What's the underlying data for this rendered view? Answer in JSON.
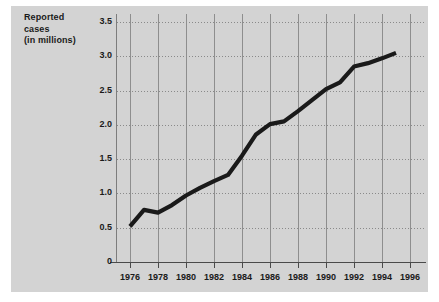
{
  "figure": {
    "background_color": "#ffffff",
    "plate_color": "#d3d3d3",
    "axis_color": "#4a4a4a",
    "gridline_color": "#8a8a8a",
    "series_color": "#1a1a1a"
  },
  "ylabel_lines": [
    "Reported",
    "cases",
    "(in millions)"
  ],
  "chart_data": {
    "type": "line",
    "title": "",
    "subtitle": "",
    "xlabel": "",
    "ylabel": "Reported cases (in millions)",
    "xlim": [
      1975,
      1997
    ],
    "ylim": [
      0,
      3.5
    ],
    "grid": true,
    "legend": false,
    "x_tick_labels": [
      "1976",
      "1978",
      "1980",
      "1982",
      "1984",
      "1986",
      "1988",
      "1990",
      "1992",
      "1994",
      "1996"
    ],
    "x_ticks": [
      1976,
      1978,
      1980,
      1982,
      1984,
      1986,
      1988,
      1990,
      1992,
      1994,
      1996
    ],
    "y_tick_labels": [
      "0",
      "0.5",
      "1.0",
      "1.5",
      "2.0",
      "2.5",
      "3.0",
      "3.5"
    ],
    "y_ticks": [
      0,
      0.5,
      1.0,
      1.5,
      2.0,
      2.5,
      3.0,
      3.5
    ],
    "series": [
      {
        "name": "Reported cases",
        "x": [
          1976,
          1977,
          1978,
          1979,
          1980,
          1981,
          1982,
          1983,
          1984,
          1985,
          1986,
          1987,
          1988,
          1989,
          1990,
          1991,
          1992,
          1993,
          1994,
          1995
        ],
        "values": [
          0.52,
          0.76,
          0.72,
          0.83,
          0.97,
          1.08,
          1.18,
          1.27,
          1.55,
          1.86,
          2.01,
          2.05,
          2.2,
          2.36,
          2.52,
          2.62,
          2.85,
          2.9,
          2.97,
          3.05
        ]
      }
    ]
  }
}
